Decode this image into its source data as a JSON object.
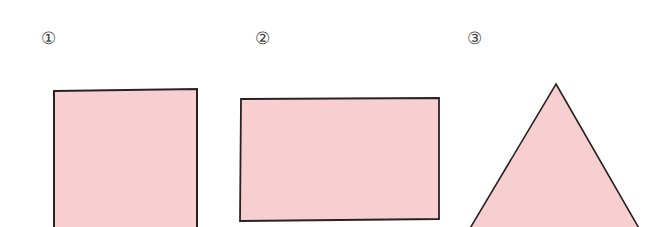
{
  "figure": {
    "labels": [
      "①",
      "②",
      "③"
    ],
    "shapes": [
      {
        "id": 1,
        "type": "square",
        "fill": "#f7cfd0",
        "stroke": "#2a2222"
      },
      {
        "id": 2,
        "type": "rectangle",
        "fill": "#f7cfd0",
        "stroke": "#2a2222"
      },
      {
        "id": 3,
        "type": "triangle",
        "fill": "#f7cfd0",
        "stroke": "#2a2222"
      }
    ]
  }
}
